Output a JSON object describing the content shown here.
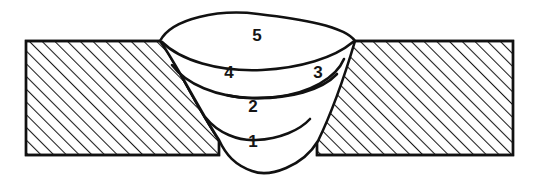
{
  "figure": {
    "background_color": "#ffffff",
    "line_color": "#111111",
    "hatch_color": "#1a1a1a",
    "label_color": "#151515"
  },
  "plates": {
    "material_name": "base-metal-plate",
    "hatch_angle_degrees": 45,
    "hatch_spacing_px": 9,
    "left": {
      "name": "left-plate",
      "top_y": 41,
      "bottom_y": 155,
      "outer_x": 26,
      "groove_top_x": 161,
      "groove_root_x": 219
    },
    "right": {
      "name": "right-plate",
      "top_y": 41,
      "bottom_y": 155,
      "outer_x": 513,
      "groove_top_x": 354,
      "groove_root_x": 317
    }
  },
  "weld": {
    "name": "weld-bead",
    "crown_top_y": 14,
    "root_bottom_y": 172,
    "left_toe_x": 160,
    "right_toe_x": 355,
    "passes": [
      {
        "number": "1",
        "name": "root-pass",
        "label_x": 253,
        "label_y": 143,
        "role": "root pass"
      },
      {
        "number": "2",
        "name": "fill-pass-2",
        "label_x": 253,
        "label_y": 108,
        "role": "filler pass"
      },
      {
        "number": "3",
        "name": "fill-pass-3",
        "label_x": 318,
        "label_y": 74,
        "role": "filler pass right"
      },
      {
        "number": "4",
        "name": "fill-pass-4",
        "label_x": 229,
        "label_y": 74,
        "role": "filler pass left"
      },
      {
        "number": "5",
        "name": "cap-pass",
        "label_x": 257,
        "label_y": 37,
        "role": "cap / cover pass"
      }
    ]
  }
}
